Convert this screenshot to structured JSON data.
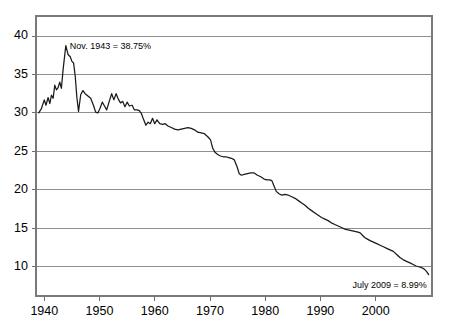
{
  "chart_data": {
    "type": "line",
    "title": "",
    "subtitle": "",
    "xlabel": "",
    "ylabel": "",
    "xlim": [
      1938.5,
      2010.2
    ],
    "ylim": [
      6.2,
      42.6
    ],
    "grid": true,
    "grid_axis": "y",
    "legend": null,
    "y_ticks": [
      40,
      35,
      30,
      25,
      20,
      15,
      10
    ],
    "y_tick_labels": [
      "40",
      "35",
      "30",
      "25",
      "20",
      "15",
      "10"
    ],
    "x_ticks": [
      1940,
      1950,
      1960,
      1970,
      1980,
      1990,
      2000
    ],
    "x_tick_labels": [
      "1940",
      "1950",
      "1960",
      "1970",
      "1980",
      "1990",
      "2000"
    ],
    "line_color": "#1a1a1a",
    "grid_color": "#8f8f8f",
    "frame_color": "#7a7a7a",
    "annotations": [
      {
        "name": "peak-annotation",
        "text": "Nov. 1943 = 38.75%",
        "x": 1943.9,
        "y": 38.75,
        "align": "left"
      },
      {
        "name": "final-annotation",
        "text": "July 2009 = 8.99%",
        "x": 2009.6,
        "y": 8.99,
        "align": "right"
      }
    ],
    "series": [
      {
        "name": "Union membership share",
        "x": [
          1939.0,
          1939.5,
          1940.0,
          1940.3,
          1940.7,
          1941.0,
          1941.3,
          1941.6,
          1941.9,
          1942.2,
          1942.5,
          1942.8,
          1943.1,
          1943.4,
          1943.9,
          1944.3,
          1944.7,
          1945.0,
          1945.3,
          1945.6,
          1945.9,
          1946.2,
          1946.6,
          1947.0,
          1947.4,
          1947.9,
          1948.4,
          1948.9,
          1949.3,
          1949.7,
          1950.1,
          1950.5,
          1950.9,
          1951.3,
          1951.8,
          1952.2,
          1952.6,
          1953.0,
          1953.4,
          1953.8,
          1954.2,
          1954.6,
          1955.0,
          1955.4,
          1955.9,
          1956.3,
          1956.8,
          1957.2,
          1957.6,
          1958.0,
          1958.4,
          1958.8,
          1959.2,
          1959.6,
          1960.0,
          1960.4,
          1960.9,
          1961.4,
          1961.9,
          1962.4,
          1963.0,
          1963.6,
          1964.2,
          1964.8,
          1965.4,
          1966.0,
          1966.6,
          1967.2,
          1967.8,
          1968.4,
          1969.0,
          1969.6,
          1970.1,
          1970.5,
          1970.9,
          1971.4,
          1971.9,
          1972.4,
          1972.9,
          1973.4,
          1973.9,
          1974.4,
          1974.9,
          1975.3,
          1975.7,
          1976.2,
          1976.8,
          1977.4,
          1978.0,
          1978.6,
          1979.2,
          1979.8,
          1980.3,
          1980.8,
          1981.2,
          1981.6,
          1982.0,
          1982.5,
          1983.0,
          1983.6,
          1984.2,
          1984.8,
          1985.4,
          1986.0,
          1986.6,
          1987.2,
          1987.8,
          1988.4,
          1989.0,
          1989.6,
          1990.2,
          1990.8,
          1991.4,
          1992.0,
          1992.6,
          1993.2,
          1993.8,
          1994.4,
          1995.0,
          1995.6,
          1996.2,
          1996.8,
          1997.2,
          1997.6,
          1998.0,
          1998.5,
          1999.0,
          1999.6,
          2000.2,
          2000.8,
          2001.4,
          2002.0,
          2002.6,
          2003.2,
          2003.8,
          2004.4,
          2005.0,
          2005.6,
          2006.2,
          2006.8,
          2007.3,
          2007.8,
          2008.3,
          2008.8,
          2009.2,
          2009.6
        ],
        "y": [
          30.0,
          30.6,
          31.7,
          31.0,
          32.0,
          31.2,
          32.3,
          31.9,
          33.6,
          33.0,
          33.3,
          34.0,
          33.2,
          35.6,
          38.75,
          37.6,
          37.3,
          36.7,
          36.5,
          34.8,
          32.0,
          30.2,
          32.4,
          32.9,
          32.5,
          32.2,
          31.9,
          31.0,
          30.1,
          30.0,
          30.6,
          31.4,
          30.9,
          30.4,
          31.6,
          32.5,
          31.7,
          32.5,
          31.8,
          31.3,
          31.5,
          30.8,
          31.4,
          30.9,
          31.0,
          30.4,
          30.4,
          30.3,
          29.9,
          29.1,
          28.4,
          28.8,
          28.6,
          29.3,
          28.6,
          29.1,
          28.6,
          28.5,
          28.6,
          28.3,
          28.1,
          27.9,
          27.8,
          27.9,
          28.0,
          28.1,
          28.0,
          27.8,
          27.5,
          27.4,
          27.3,
          26.9,
          26.5,
          25.4,
          24.9,
          24.6,
          24.4,
          24.3,
          24.3,
          24.2,
          24.1,
          23.9,
          23.0,
          22.1,
          21.9,
          22.0,
          22.1,
          22.2,
          22.2,
          21.9,
          21.7,
          21.4,
          21.3,
          21.3,
          21.2,
          20.5,
          19.8,
          19.5,
          19.3,
          19.4,
          19.3,
          19.1,
          18.9,
          18.6,
          18.3,
          18.0,
          17.6,
          17.3,
          17.0,
          16.7,
          16.4,
          16.2,
          16.0,
          15.7,
          15.5,
          15.3,
          15.1,
          14.9,
          14.8,
          14.7,
          14.6,
          14.5,
          14.4,
          14.1,
          13.8,
          13.6,
          13.4,
          13.2,
          13.0,
          12.8,
          12.6,
          12.4,
          12.2,
          12.0,
          11.6,
          11.2,
          10.9,
          10.7,
          10.5,
          10.3,
          10.1,
          10.0,
          9.9,
          9.7,
          9.4,
          8.99
        ]
      }
    ]
  }
}
